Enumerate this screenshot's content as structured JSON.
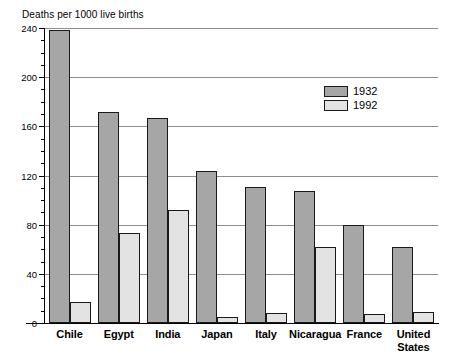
{
  "chart_data": {
    "type": "bar",
    "title": "Deaths per 1000 live births",
    "xlabel": "",
    "ylabel": "Deaths per 1000 live births",
    "ylim": [
      0,
      240
    ],
    "ytick_step": 40,
    "yminor_step": 10,
    "grid": true,
    "legend_position": "upper-right-inside",
    "categories": [
      "Chile",
      "Egypt",
      "India",
      "Japan",
      "Italy",
      "Nicaragua",
      "France",
      "United States"
    ],
    "category_lines": [
      [
        "Chile"
      ],
      [
        "Egypt"
      ],
      [
        "India"
      ],
      [
        "Japan"
      ],
      [
        "Italy"
      ],
      [
        "Nicaragua"
      ],
      [
        "France"
      ],
      [
        "United",
        "States"
      ]
    ],
    "series": [
      {
        "name": "1932",
        "color": "#a6a6a6",
        "values": [
          238,
          172,
          167,
          124,
          111,
          107,
          80,
          62
        ]
      },
      {
        "name": "1992",
        "color": "#e3e3e3",
        "values": [
          17,
          73,
          92,
          5,
          8,
          62,
          7,
          9
        ]
      }
    ],
    "ytick_labels": [
      "0",
      "40",
      "80",
      "120",
      "160",
      "200",
      "240"
    ],
    "ytick_values": [
      0,
      40,
      80,
      120,
      160,
      200,
      240
    ]
  },
  "legend": {
    "items": [
      {
        "label": "1932",
        "color": "#a6a6a6"
      },
      {
        "label": "1992",
        "color": "#e3e3e3"
      }
    ]
  },
  "colors": {
    "series_1932": "#a6a6a6",
    "series_1992": "#e3e3e3",
    "gridline": "#8d8d8d",
    "axis": "#000000",
    "background": "#ffffff"
  }
}
